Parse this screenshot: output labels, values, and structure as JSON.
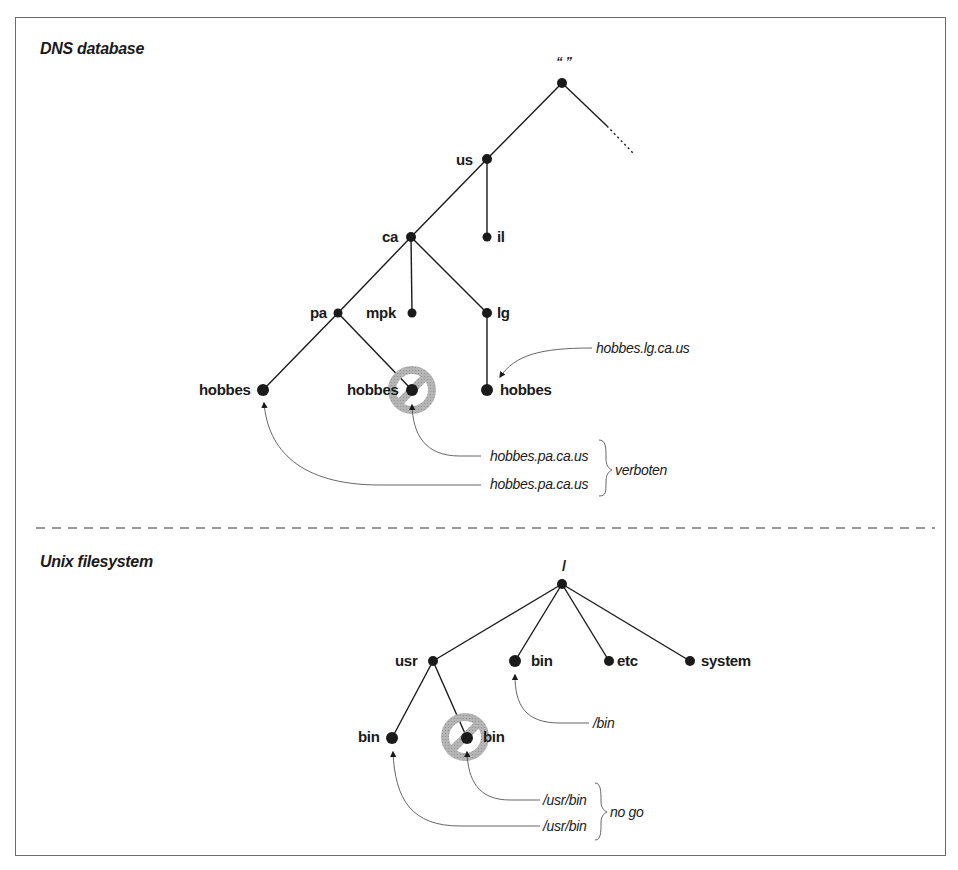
{
  "colors": {
    "ink": "#1a1a1a",
    "leader": "#555555",
    "prohibit": "#a8a8a8",
    "frame": "#6b6b6b",
    "background": "#ffffff"
  },
  "dns": {
    "title": "DNS database",
    "nodes": {
      "root": "“ ”",
      "us": "us",
      "il": "il",
      "ca": "ca",
      "pa": "pa",
      "mpk": "mpk",
      "lg": "lg",
      "hobbes_pa_1": "hobbes",
      "hobbes_pa_2": "hobbes",
      "hobbes_lg": "hobbes"
    },
    "callouts": {
      "lg": "hobbes.lg.ca.us",
      "pa_top": "hobbes.pa.ca.us",
      "pa_bottom": "hobbes.pa.ca.us",
      "brace_label": "verboten"
    }
  },
  "unix": {
    "title": "Unix filesystem",
    "nodes": {
      "root": "/",
      "usr": "usr",
      "bin": "bin",
      "etc": "etc",
      "system": "system",
      "usr_bin_1": "bin",
      "usr_bin_2": "bin"
    },
    "callouts": {
      "bin": "/bin",
      "usr_top": "/usr/bin",
      "usr_bottom": "/usr/bin",
      "brace_label": "no go"
    }
  }
}
